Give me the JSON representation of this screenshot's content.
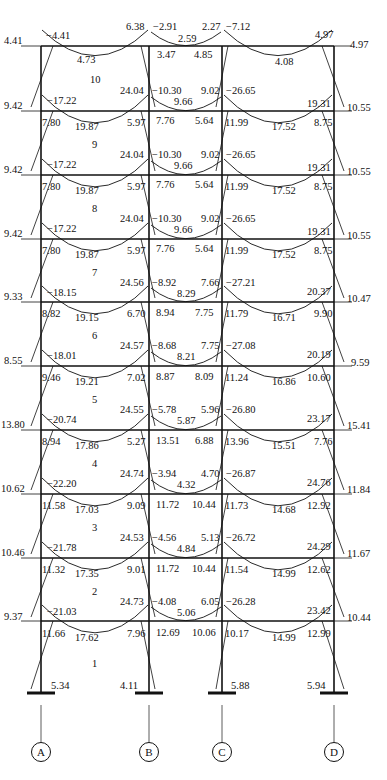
{
  "diagram": {
    "type": "frame-moment-diagram",
    "axes": [
      "A",
      "B",
      "C",
      "D"
    ],
    "columns_x": [
      41,
      149,
      222,
      334
    ],
    "floor_levels_y": [
      46,
      111,
      175,
      239,
      302,
      366,
      430,
      494,
      558,
      621
    ],
    "support_y": 693,
    "stories": [
      {
        "label": "10",
        "top_y": 46
      },
      {
        "label": "9",
        "top_y": 111
      },
      {
        "label": "8",
        "top_y": 175
      },
      {
        "label": "7",
        "top_y": 239
      },
      {
        "label": "6",
        "top_y": 302
      },
      {
        "label": "5",
        "top_y": 366
      },
      {
        "label": "4",
        "top_y": 430
      },
      {
        "label": "3",
        "top_y": 494
      },
      {
        "label": "2",
        "top_y": 558
      },
      {
        "label": "1",
        "top_y": 621
      }
    ]
  },
  "labels": [
    {
      "t": "4.41",
      "x": 4,
      "y": 36
    },
    {
      "t": "−4.41",
      "x": 46,
      "y": 31
    },
    {
      "t": "6.38",
      "x": 126,
      "y": 22
    },
    {
      "t": "−2.91",
      "x": 153,
      "y": 22
    },
    {
      "t": "2.59",
      "x": 178,
      "y": 34
    },
    {
      "t": "2.27",
      "x": 202,
      "y": 22
    },
    {
      "t": "−7.12",
      "x": 226,
      "y": 22
    },
    {
      "t": "4.97",
      "x": 315,
      "y": 30
    },
    {
      "t": "4.97",
      "x": 350,
      "y": 40
    },
    {
      "t": "4.73",
      "x": 77,
      "y": 55
    },
    {
      "t": "3.47",
      "x": 157,
      "y": 50
    },
    {
      "t": "4.85",
      "x": 194,
      "y": 50
    },
    {
      "t": "4.08",
      "x": 275,
      "y": 57
    },
    {
      "t": "10",
      "x": 90,
      "y": 75
    },
    {
      "t": "24.04",
      "x": 120,
      "y": 86
    },
    {
      "t": "−10.30",
      "x": 152,
      "y": 86
    },
    {
      "t": "9.66",
      "x": 174,
      "y": 97
    },
    {
      "t": "9.02",
      "x": 201,
      "y": 86
    },
    {
      "t": "−26.65",
      "x": 226,
      "y": 86
    },
    {
      "t": "19.31",
      "x": 307,
      "y": 99
    },
    {
      "t": "10.55",
      "x": 347,
      "y": 103
    },
    {
      "t": "9.42",
      "x": 4,
      "y": 101
    },
    {
      "t": "−17.22",
      "x": 47,
      "y": 96
    },
    {
      "t": "7.80",
      "x": 42,
      "y": 118
    },
    {
      "t": "19.87",
      "x": 75,
      "y": 122
    },
    {
      "t": "5.97",
      "x": 127,
      "y": 118
    },
    {
      "t": "7.76",
      "x": 156,
      "y": 116
    },
    {
      "t": "5.64",
      "x": 195,
      "y": 116
    },
    {
      "t": "11.99",
      "x": 225,
      "y": 118
    },
    {
      "t": "17.52",
      "x": 272,
      "y": 122
    },
    {
      "t": "8.75",
      "x": 314,
      "y": 118
    },
    {
      "t": "9",
      "x": 92,
      "y": 140
    },
    {
      "t": "24.04",
      "x": 120,
      "y": 150
    },
    {
      "t": "−10.30",
      "x": 152,
      "y": 150
    },
    {
      "t": "9.66",
      "x": 174,
      "y": 161
    },
    {
      "t": "9.02",
      "x": 201,
      "y": 150
    },
    {
      "t": "−26.65",
      "x": 226,
      "y": 150
    },
    {
      "t": "19.31",
      "x": 307,
      "y": 163
    },
    {
      "t": "10.55",
      "x": 347,
      "y": 167
    },
    {
      "t": "9.42",
      "x": 4,
      "y": 165
    },
    {
      "t": "−17.22",
      "x": 47,
      "y": 160
    },
    {
      "t": "7.80",
      "x": 42,
      "y": 182
    },
    {
      "t": "19.87",
      "x": 75,
      "y": 186
    },
    {
      "t": "5.97",
      "x": 127,
      "y": 182
    },
    {
      "t": "7.76",
      "x": 156,
      "y": 180
    },
    {
      "t": "5.64",
      "x": 195,
      "y": 180
    },
    {
      "t": "11.99",
      "x": 225,
      "y": 182
    },
    {
      "t": "17.52",
      "x": 272,
      "y": 186
    },
    {
      "t": "8.75",
      "x": 314,
      "y": 182
    },
    {
      "t": "8",
      "x": 92,
      "y": 204
    },
    {
      "t": "24.04",
      "x": 120,
      "y": 214
    },
    {
      "t": "−10.30",
      "x": 152,
      "y": 214
    },
    {
      "t": "9.66",
      "x": 174,
      "y": 225
    },
    {
      "t": "9.02",
      "x": 201,
      "y": 214
    },
    {
      "t": "−26.65",
      "x": 226,
      "y": 214
    },
    {
      "t": "19.31",
      "x": 307,
      "y": 227
    },
    {
      "t": "10.55",
      "x": 347,
      "y": 231
    },
    {
      "t": "9.42",
      "x": 4,
      "y": 229
    },
    {
      "t": "−17.22",
      "x": 47,
      "y": 224
    },
    {
      "t": "7.80",
      "x": 42,
      "y": 246
    },
    {
      "t": "19.87",
      "x": 75,
      "y": 250
    },
    {
      "t": "5.97",
      "x": 127,
      "y": 246
    },
    {
      "t": "7.76",
      "x": 156,
      "y": 244
    },
    {
      "t": "5.64",
      "x": 195,
      "y": 244
    },
    {
      "t": "11.99",
      "x": 225,
      "y": 246
    },
    {
      "t": "17.52",
      "x": 272,
      "y": 250
    },
    {
      "t": "8.75",
      "x": 314,
      "y": 246
    },
    {
      "t": "7",
      "x": 92,
      "y": 268
    },
    {
      "t": "24.56",
      "x": 120,
      "y": 278
    },
    {
      "t": "−8.92",
      "x": 152,
      "y": 278
    },
    {
      "t": "8.29",
      "x": 177,
      "y": 289
    },
    {
      "t": "7.66",
      "x": 201,
      "y": 278
    },
    {
      "t": "−27.21",
      "x": 226,
      "y": 278
    },
    {
      "t": "20.37",
      "x": 307,
      "y": 287
    },
    {
      "t": "10.47",
      "x": 347,
      "y": 294
    },
    {
      "t": "9.33",
      "x": 4,
      "y": 292
    },
    {
      "t": "−18.15",
      "x": 47,
      "y": 288
    },
    {
      "t": "8.82",
      "x": 42,
      "y": 309
    },
    {
      "t": "19.15",
      "x": 75,
      "y": 313
    },
    {
      "t": "6.70",
      "x": 127,
      "y": 309
    },
    {
      "t": "8.94",
      "x": 156,
      "y": 308
    },
    {
      "t": "7.75",
      "x": 195,
      "y": 308
    },
    {
      "t": "11.79",
      "x": 225,
      "y": 309
    },
    {
      "t": "16.71",
      "x": 272,
      "y": 313
    },
    {
      "t": "9.90",
      "x": 314,
      "y": 309
    },
    {
      "t": "6",
      "x": 92,
      "y": 331
    },
    {
      "t": "24.57",
      "x": 120,
      "y": 341
    },
    {
      "t": "−8.68",
      "x": 152,
      "y": 341
    },
    {
      "t": "8.21",
      "x": 177,
      "y": 352
    },
    {
      "t": "7.75",
      "x": 201,
      "y": 341
    },
    {
      "t": "−27.08",
      "x": 226,
      "y": 341
    },
    {
      "t": "20.19",
      "x": 307,
      "y": 350
    },
    {
      "t": "9.59",
      "x": 351,
      "y": 358
    },
    {
      "t": "8.55",
      "x": 4,
      "y": 356
    },
    {
      "t": "−18.01",
      "x": 47,
      "y": 351
    },
    {
      "t": "9.46",
      "x": 42,
      "y": 373
    },
    {
      "t": "19.21",
      "x": 75,
      "y": 377
    },
    {
      "t": "7.02",
      "x": 127,
      "y": 373
    },
    {
      "t": "8.87",
      "x": 156,
      "y": 372
    },
    {
      "t": "8.09",
      "x": 195,
      "y": 372
    },
    {
      "t": "11.24",
      "x": 225,
      "y": 373
    },
    {
      "t": "16.86",
      "x": 272,
      "y": 377
    },
    {
      "t": "10.60",
      "x": 307,
      "y": 373
    },
    {
      "t": "5",
      "x": 92,
      "y": 395
    },
    {
      "t": "24.55",
      "x": 120,
      "y": 405
    },
    {
      "t": "−5.78",
      "x": 152,
      "y": 405
    },
    {
      "t": "5.87",
      "x": 177,
      "y": 416
    },
    {
      "t": "5.96",
      "x": 201,
      "y": 405
    },
    {
      "t": "−26.80",
      "x": 226,
      "y": 405
    },
    {
      "t": "23.17",
      "x": 307,
      "y": 414
    },
    {
      "t": "15.41",
      "x": 347,
      "y": 421
    },
    {
      "t": "13.80",
      "x": 1,
      "y": 420
    },
    {
      "t": "−20.74",
      "x": 47,
      "y": 415
    },
    {
      "t": "8.94",
      "x": 42,
      "y": 437
    },
    {
      "t": "17.86",
      "x": 75,
      "y": 441
    },
    {
      "t": "5.27",
      "x": 127,
      "y": 437
    },
    {
      "t": "13.51",
      "x": 156,
      "y": 436
    },
    {
      "t": "6.88",
      "x": 195,
      "y": 436
    },
    {
      "t": "13.96",
      "x": 225,
      "y": 437
    },
    {
      "t": "15.51",
      "x": 272,
      "y": 441
    },
    {
      "t": "7.76",
      "x": 314,
      "y": 437
    },
    {
      "t": "4",
      "x": 92,
      "y": 459
    },
    {
      "t": "24.74",
      "x": 120,
      "y": 469
    },
    {
      "t": "−3.94",
      "x": 152,
      "y": 469
    },
    {
      "t": "4.32",
      "x": 177,
      "y": 480
    },
    {
      "t": "4.70",
      "x": 201,
      "y": 469
    },
    {
      "t": "−26.87",
      "x": 226,
      "y": 469
    },
    {
      "t": "24.76",
      "x": 307,
      "y": 478
    },
    {
      "t": "11.84",
      "x": 347,
      "y": 485
    },
    {
      "t": "10.62",
      "x": 1,
      "y": 484
    },
    {
      "t": "−22.20",
      "x": 47,
      "y": 479
    },
    {
      "t": "11.58",
      "x": 42,
      "y": 501
    },
    {
      "t": "17.03",
      "x": 75,
      "y": 505
    },
    {
      "t": "9.09",
      "x": 127,
      "y": 501
    },
    {
      "t": "11.72",
      "x": 156,
      "y": 500
    },
    {
      "t": "10.44",
      "x": 192,
      "y": 500
    },
    {
      "t": "11.73",
      "x": 225,
      "y": 501
    },
    {
      "t": "14.68",
      "x": 272,
      "y": 505
    },
    {
      "t": "12.92",
      "x": 307,
      "y": 501
    },
    {
      "t": "3",
      "x": 92,
      "y": 523
    },
    {
      "t": "24.53",
      "x": 120,
      "y": 533
    },
    {
      "t": "−4.56",
      "x": 152,
      "y": 533
    },
    {
      "t": "4.84",
      "x": 177,
      "y": 544
    },
    {
      "t": "5.13",
      "x": 201,
      "y": 533
    },
    {
      "t": "−26.72",
      "x": 226,
      "y": 533
    },
    {
      "t": "24.29",
      "x": 307,
      "y": 542
    },
    {
      "t": "11.67",
      "x": 347,
      "y": 549
    },
    {
      "t": "10.46",
      "x": 1,
      "y": 548
    },
    {
      "t": "−21.78",
      "x": 47,
      "y": 543
    },
    {
      "t": "11.32",
      "x": 42,
      "y": 565
    },
    {
      "t": "17.35",
      "x": 75,
      "y": 569
    },
    {
      "t": "9.01",
      "x": 127,
      "y": 565
    },
    {
      "t": "11.72",
      "x": 156,
      "y": 564
    },
    {
      "t": "10.44",
      "x": 192,
      "y": 564
    },
    {
      "t": "11.54",
      "x": 225,
      "y": 565
    },
    {
      "t": "14.99",
      "x": 272,
      "y": 569
    },
    {
      "t": "12.62",
      "x": 307,
      "y": 565
    },
    {
      "t": "2",
      "x": 92,
      "y": 587
    },
    {
      "t": "24.73",
      "x": 120,
      "y": 597
    },
    {
      "t": "−4.08",
      "x": 152,
      "y": 597
    },
    {
      "t": "5.06",
      "x": 177,
      "y": 608
    },
    {
      "t": "6.05",
      "x": 201,
      "y": 597
    },
    {
      "t": "−26.28",
      "x": 226,
      "y": 597
    },
    {
      "t": "23.42",
      "x": 307,
      "y": 606
    },
    {
      "t": "10.44",
      "x": 347,
      "y": 613
    },
    {
      "t": "9.37",
      "x": 4,
      "y": 612
    },
    {
      "t": "−21.03",
      "x": 47,
      "y": 607
    },
    {
      "t": "11.66",
      "x": 42,
      "y": 629
    },
    {
      "t": "17.62",
      "x": 75,
      "y": 633
    },
    {
      "t": "7.96",
      "x": 127,
      "y": 629
    },
    {
      "t": "12.69",
      "x": 156,
      "y": 628
    },
    {
      "t": "10.06",
      "x": 192,
      "y": 628
    },
    {
      "t": "10.17",
      "x": 225,
      "y": 629
    },
    {
      "t": "14.99",
      "x": 272,
      "y": 633
    },
    {
      "t": "12.99",
      "x": 307,
      "y": 629
    },
    {
      "t": "1",
      "x": 92,
      "y": 659
    },
    {
      "t": "5.34",
      "x": 51,
      "y": 681
    },
    {
      "t": "4.11",
      "x": 120,
      "y": 681
    },
    {
      "t": "5.88",
      "x": 231,
      "y": 681
    },
    {
      "t": "5.94",
      "x": 307,
      "y": 681
    }
  ]
}
